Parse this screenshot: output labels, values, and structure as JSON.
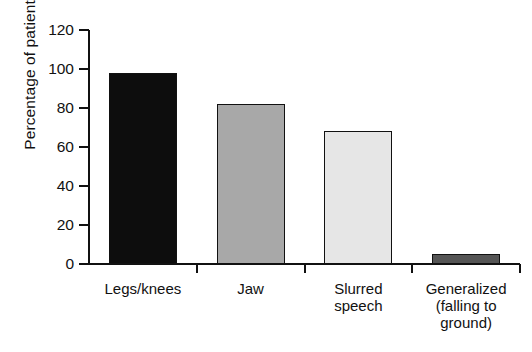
{
  "chart_data": {
    "type": "bar",
    "title": "",
    "subtitle": "",
    "xlabel": "",
    "ylabel": "Percentage of patients",
    "categories": [
      "Legs/knees",
      "Jaw",
      "Slurred speech",
      "Generalized (falling to ground)"
    ],
    "category_lines": [
      [
        "Legs/knees"
      ],
      [
        "Jaw"
      ],
      [
        "Slurred",
        "speech"
      ],
      [
        "Generalized",
        "(falling to",
        "ground)"
      ]
    ],
    "values": [
      98,
      82,
      68,
      5
    ],
    "bar_colors": [
      "#0d0d0d",
      "#a8a8a8",
      "#e6e6e6",
      "#555555"
    ],
    "bar_border_color": "#111111",
    "ylim": [
      0,
      120
    ],
    "yticks": [
      0,
      20,
      40,
      60,
      80,
      100,
      120
    ],
    "ytick_labels": [
      "0",
      "20",
      "40",
      "60",
      "80",
      "100",
      "120"
    ],
    "grid": false,
    "legend": "none",
    "legend_position": "none"
  }
}
